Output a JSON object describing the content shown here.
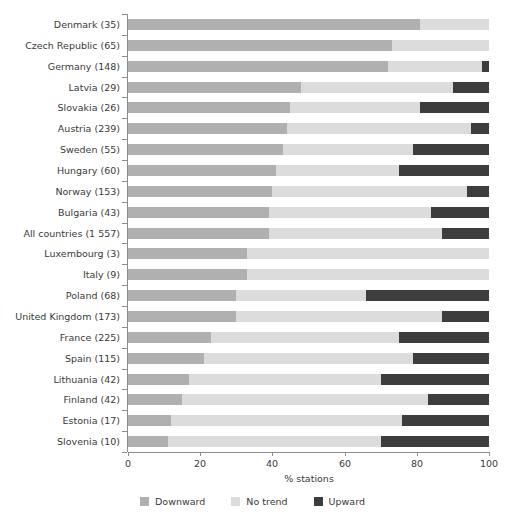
{
  "chart_data": {
    "type": "bar",
    "subtype": "horizontal-stacked-percentage",
    "title": "",
    "xlabel": "% stations",
    "ylabel": "",
    "xlim": [
      0,
      100
    ],
    "xticks": [
      0,
      20,
      40,
      60,
      80,
      100
    ],
    "grid": false,
    "legend_position": "bottom-center",
    "categories": [
      "Denmark (35)",
      "Czech Republic (65)",
      "Germany (148)",
      "Latvia (29)",
      "Slovakia (26)",
      "Austria (239)",
      "Sweden (55)",
      "Hungary (60)",
      "Norway (153)",
      "Bulgaria (43)",
      "All countries (1 557)",
      "Luxembourg (3)",
      "Italy (9)",
      "Poland (68)",
      "United Kingdom (173)",
      "France (225)",
      "Spain (115)",
      "Lithuania (42)",
      "Finland (42)",
      "Estonia (17)",
      "Slovenia (10)"
    ],
    "series": [
      {
        "name": "Downward",
        "color": "#b0b0b0",
        "values": [
          81,
          73,
          72,
          48,
          45,
          44,
          43,
          41,
          40,
          39,
          39,
          33,
          33,
          30,
          30,
          23,
          21,
          17,
          15,
          12,
          11
        ]
      },
      {
        "name": "No trend",
        "color": "#dcdcdc",
        "values": [
          19,
          27,
          26,
          42,
          36,
          51,
          36,
          34,
          54,
          45,
          48,
          67,
          67,
          36,
          57,
          52,
          58,
          53,
          68,
          64,
          59
        ]
      },
      {
        "name": "Upward",
        "color": "#3d3d3d",
        "values": [
          0,
          0,
          2,
          10,
          19,
          5,
          21,
          25,
          6,
          16,
          13,
          0,
          0,
          34,
          13,
          25,
          21,
          30,
          17,
          24,
          30
        ]
      }
    ]
  },
  "legend": {
    "items": [
      {
        "label": "Downward",
        "color": "#b0b0b0"
      },
      {
        "label": "No trend",
        "color": "#dcdcdc"
      },
      {
        "label": "Upward",
        "color": "#3d3d3d"
      }
    ]
  },
  "axis": {
    "x_title": "% stations",
    "x_tick_labels": [
      "0",
      "20",
      "40",
      "60",
      "80",
      "100"
    ]
  }
}
